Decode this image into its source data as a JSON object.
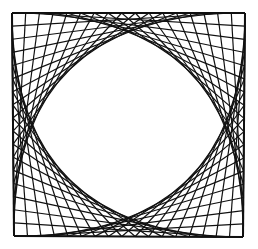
{
  "figure": {
    "stroke_color": "#111111",
    "background": "#ffffff",
    "frame": {
      "top_left": [
        12,
        13
      ],
      "top_right": [
        245,
        13
      ],
      "bottom_right": [
        243,
        237
      ],
      "bottom_left": [
        14,
        236
      ]
    },
    "divisions": 17,
    "corners": [
      "top-left",
      "top-right",
      "bottom-right",
      "bottom-left"
    ]
  }
}
